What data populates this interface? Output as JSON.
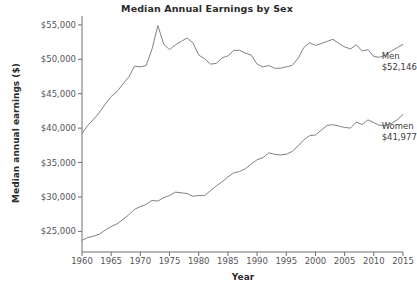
{
  "chart_data": {
    "type": "line",
    "title": "Median Annual Earnings by Sex",
    "xlabel": "Year",
    "ylabel": "Median annual earnings ($)",
    "xlim": [
      1960,
      2015
    ],
    "ylim": [
      22000,
      56000
    ],
    "xticks": [
      1960,
      1965,
      1970,
      1975,
      1980,
      1985,
      1990,
      1995,
      2000,
      2005,
      2010,
      2015
    ],
    "xtick_labels": [
      "1960",
      "1965",
      "1970",
      "1975",
      "1980",
      "1985",
      "1990",
      "1995",
      "2000",
      "2005",
      "2010",
      "2015"
    ],
    "yticks": [
      25000,
      30000,
      35000,
      40000,
      45000,
      50000,
      55000
    ],
    "ytick_labels": [
      "$25,000",
      "$30,000",
      "$35,000",
      "$40,000",
      "$45,000",
      "$50,000",
      "$55,000"
    ],
    "grid": false,
    "legend": "annotations at right end of each line",
    "line_color": "#808080",
    "axis_color": "#6e6e6e",
    "x": [
      1960,
      1961,
      1962,
      1963,
      1964,
      1965,
      1966,
      1967,
      1968,
      1969,
      1970,
      1971,
      1972,
      1973,
      1974,
      1975,
      1976,
      1977,
      1978,
      1979,
      1980,
      1981,
      1982,
      1983,
      1984,
      1985,
      1986,
      1987,
      1988,
      1989,
      1990,
      1991,
      1992,
      1993,
      1994,
      1995,
      1996,
      1997,
      1998,
      1999,
      2000,
      2001,
      2002,
      2003,
      2004,
      2005,
      2006,
      2007,
      2008,
      2009,
      2010,
      2011,
      2012,
      2013,
      2014,
      2015
    ],
    "series": [
      {
        "name": "Men",
        "end_label": "Men",
        "end_value_label": "$52,146",
        "end_value": 52146,
        "values": [
          39200,
          40400,
          41300,
          42300,
          43500,
          44600,
          45300,
          46400,
          47400,
          49000,
          48900,
          49100,
          51500,
          54900,
          52200,
          51400,
          52100,
          52600,
          53100,
          52400,
          50600,
          50100,
          49300,
          49400,
          50200,
          50500,
          51300,
          51300,
          50900,
          50600,
          49300,
          48900,
          49100,
          48700,
          48700,
          48900,
          49100,
          50100,
          51700,
          52400,
          52000,
          52300,
          52600,
          52900,
          52300,
          51800,
          51500,
          52100,
          51200,
          51400,
          50400,
          50300,
          50600,
          51200,
          51700,
          52146
        ]
      },
      {
        "name": "Women",
        "end_label": "Women",
        "end_value_label": "$41,977",
        "end_value": 41977,
        "values": [
          23700,
          24100,
          24300,
          24600,
          25200,
          25700,
          26100,
          26700,
          27400,
          28200,
          28600,
          28900,
          29500,
          29400,
          29900,
          30200,
          30700,
          30600,
          30500,
          30100,
          30200,
          30200,
          30900,
          31600,
          32200,
          32900,
          33500,
          33700,
          34100,
          34800,
          35400,
          35700,
          36400,
          36200,
          36100,
          36200,
          36600,
          37400,
          38300,
          38900,
          39000,
          39700,
          40400,
          40500,
          40300,
          40100,
          40000,
          40900,
          40500,
          41200,
          40800,
          40400,
          40400,
          40700,
          41200,
          41977
        ]
      }
    ]
  }
}
